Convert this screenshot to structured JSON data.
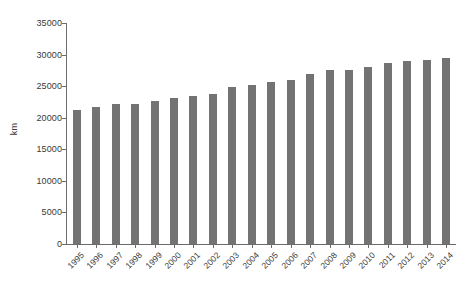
{
  "chart_data": {
    "type": "bar",
    "title": "",
    "subtitle": "",
    "xlabel": "",
    "ylabel": "km",
    "categories": [
      "1995",
      "1996",
      "1997",
      "1998",
      "1999",
      "2000",
      "2001",
      "2002",
      "2003",
      "2004",
      "2005",
      "2006",
      "2007",
      "2008",
      "2009",
      "2010",
      "2011",
      "2012",
      "2013",
      "2014"
    ],
    "values": [
      21300,
      21700,
      22100,
      22100,
      22700,
      23200,
      23400,
      23800,
      24900,
      25200,
      25700,
      26000,
      26900,
      27500,
      27600,
      28100,
      28600,
      29000,
      29100,
      29500
    ],
    "series": [
      {
        "name": "km",
        "values": [
          21300,
          21700,
          22100,
          22100,
          22700,
          23200,
          23400,
          23800,
          24900,
          25200,
          25700,
          26000,
          26900,
          27500,
          27600,
          28100,
          28600,
          29000,
          29100,
          29500
        ]
      }
    ],
    "ylim": [
      0,
      35000
    ],
    "yticks": [
      0,
      5000,
      10000,
      15000,
      20000,
      25000,
      30000,
      35000
    ],
    "ytick_labels": [
      "0",
      "5000",
      "10000",
      "15000",
      "20000",
      "25000",
      "30000",
      "35000"
    ],
    "grid": false,
    "legend": "none",
    "bar_color": "#737373",
    "axis_color": "#6b6b6b",
    "text_color": "#3a3a3a",
    "background_color": "#ffffff"
  }
}
